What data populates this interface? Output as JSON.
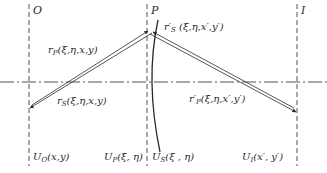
{
  "planes": {
    "object": {
      "label": "O",
      "field": "U",
      "field_sub": "O",
      "field_args": "(x,y)"
    },
    "pupil": {
      "label": "P",
      "field": "U",
      "field_sub": "P",
      "field_args": "(ξ, η)"
    },
    "surface": {
      "field": "U",
      "field_sub": "S",
      "field_args": "(ξ , η)"
    },
    "image": {
      "label": "I",
      "field": "U",
      "field_sub": "I",
      "field_args": "(x′, y′)"
    }
  },
  "rays": {
    "rP": {
      "sym": "r",
      "sub": "P",
      "args": "(ξ,η,x,y)"
    },
    "rS": {
      "sym": "r",
      "sub": "S",
      "args": "(ξ,η,x,y)"
    },
    "rS_prime": {
      "sym": "r′",
      "sub": "S",
      "args": " (ξ,η,x′,y′)"
    },
    "rP_prime": {
      "sym": "r′",
      "sub": "P",
      "args": "(ξ,η,x′,y′)"
    }
  },
  "colors": {
    "line": "#2a2a2a",
    "background": "#ffffff"
  }
}
